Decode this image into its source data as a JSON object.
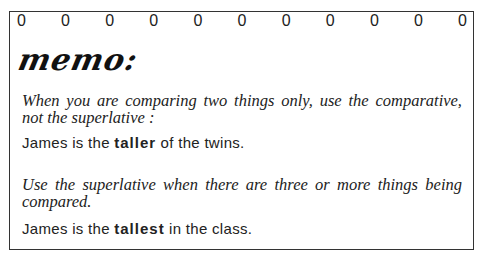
{
  "memo": {
    "header_marks": [
      "0",
      "0",
      "0",
      "0",
      "0",
      "0",
      "0",
      "0",
      "0",
      "0",
      "0"
    ],
    "title": "memo:",
    "rule1": "When you are comparing two things only, use the comparative, not the superlative :",
    "example1": {
      "before": "James is the ",
      "bold": "taller",
      "after": " of the twins."
    },
    "rule2": "Use the superlative when there are three or more things being compared.",
    "example2": {
      "before": "James is the ",
      "bold": "tallest",
      "after": " in the class."
    }
  }
}
